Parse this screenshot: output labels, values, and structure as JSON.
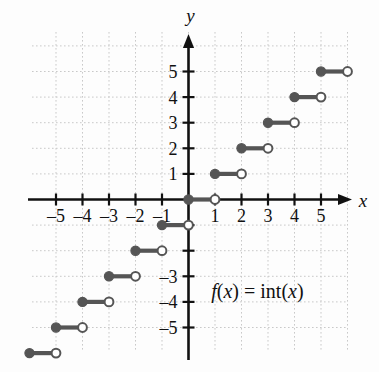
{
  "figure": {
    "title": "",
    "function_label_parts": {
      "f": "f",
      "open1": "(",
      "x1": "x",
      "close1": ")",
      "equals": " = ",
      "int": "int",
      "open2": "(",
      "x2": "x",
      "close2": ")"
    },
    "function_label": "f(x) = int(x)",
    "x_axis_label": "x",
    "y_axis_label": "y",
    "colors": {
      "axis": "#111111",
      "grid": "#c9c9c9",
      "step": "#555555",
      "open_dot_fill": "#ffffff",
      "background": "#fdfdfd"
    }
  },
  "chart_data": {
    "type": "line",
    "title": "",
    "subtitle": "",
    "xlabel": "x",
    "ylabel": "y",
    "xlim": [
      -6.3,
      6.3
    ],
    "ylim": [
      -6.4,
      6.0
    ],
    "grid": true,
    "legend": null,
    "annotations": [
      {
        "text": "f(x) = int(x)",
        "x": 2.6,
        "y": -3.6
      }
    ],
    "x_ticks": [
      -5,
      -4,
      -3,
      -2,
      -1,
      1,
      2,
      3,
      4,
      5
    ],
    "x_tick_labels": [
      "–5",
      "–4",
      "–3",
      "–2",
      "–1",
      "1",
      "2",
      "3",
      "4",
      "5"
    ],
    "y_ticks": [
      5,
      4,
      3,
      2,
      1,
      -1,
      -2,
      -3,
      -4,
      -5
    ],
    "y_tick_labels": [
      "5",
      "4",
      "3",
      "2",
      "1",
      "",
      "",
      "–3",
      "–4",
      "–5"
    ],
    "series": [
      {
        "name": "int(x)",
        "style": "step",
        "segments": [
          {
            "x_start": 5,
            "x_end": 6,
            "y": 5,
            "left_closed": true,
            "right_closed": false
          },
          {
            "x_start": 4,
            "x_end": 5,
            "y": 4,
            "left_closed": true,
            "right_closed": false
          },
          {
            "x_start": 3,
            "x_end": 4,
            "y": 3,
            "left_closed": true,
            "right_closed": false
          },
          {
            "x_start": 2,
            "x_end": 3,
            "y": 2,
            "left_closed": true,
            "right_closed": false
          },
          {
            "x_start": 1,
            "x_end": 2,
            "y": 1,
            "left_closed": true,
            "right_closed": false
          },
          {
            "x_start": 0,
            "x_end": 1,
            "y": 0,
            "left_closed": true,
            "right_closed": false
          },
          {
            "x_start": -1,
            "x_end": 0,
            "y": -1,
            "left_closed": true,
            "right_closed": false
          },
          {
            "x_start": -2,
            "x_end": -1,
            "y": -2,
            "left_closed": true,
            "right_closed": false
          },
          {
            "x_start": -3,
            "x_end": -2,
            "y": -3,
            "left_closed": true,
            "right_closed": false
          },
          {
            "x_start": -4,
            "x_end": -3,
            "y": -4,
            "left_closed": true,
            "right_closed": false
          },
          {
            "x_start": -5,
            "x_end": -4,
            "y": -5,
            "left_closed": true,
            "right_closed": false
          },
          {
            "x_start": -6,
            "x_end": -5,
            "y": -6,
            "left_closed": true,
            "right_closed": false
          }
        ]
      }
    ]
  }
}
